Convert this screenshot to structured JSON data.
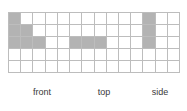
{
  "figure": {
    "title": "",
    "type": "orthographic-views-grid-diagram",
    "grid": {
      "columns": 14,
      "rows": 5,
      "line_color": "#bdbdbd",
      "cell_fill_empty": "#ffffff",
      "cell_fill_shaded": "#b3b3b3",
      "background": "#ffffff"
    },
    "views": [
      {
        "id": "front",
        "label_line1": "front",
        "label_line2": "view",
        "shaded_cells": [
          {
            "row": 1,
            "col": 1
          },
          {
            "row": 2,
            "col": 1
          },
          {
            "row": 2,
            "col": 2
          },
          {
            "row": 3,
            "col": 1
          },
          {
            "row": 3,
            "col": 2
          },
          {
            "row": 3,
            "col": 3
          }
        ],
        "square_count": 6
      },
      {
        "id": "top",
        "label_line1": "top",
        "label_line2": "view",
        "shaded_cells": [
          {
            "row": 3,
            "col": 6
          },
          {
            "row": 3,
            "col": 7
          },
          {
            "row": 3,
            "col": 8
          }
        ],
        "square_count": 3
      },
      {
        "id": "side",
        "label_line1": "side",
        "label_line2": "view",
        "shaded_cells": [
          {
            "row": 1,
            "col": 12
          },
          {
            "row": 2,
            "col": 12
          },
          {
            "row": 3,
            "col": 12
          }
        ],
        "square_count": 3
      }
    ],
    "shaded_cells_all": [
      {
        "row": 1,
        "col": 1
      },
      {
        "row": 2,
        "col": 1
      },
      {
        "row": 2,
        "col": 2
      },
      {
        "row": 3,
        "col": 1
      },
      {
        "row": 3,
        "col": 2
      },
      {
        "row": 3,
        "col": 3
      },
      {
        "row": 3,
        "col": 6
      },
      {
        "row": 3,
        "col": 7
      },
      {
        "row": 3,
        "col": 8
      },
      {
        "row": 1,
        "col": 12
      },
      {
        "row": 2,
        "col": 12
      },
      {
        "row": 3,
        "col": 12
      }
    ]
  }
}
